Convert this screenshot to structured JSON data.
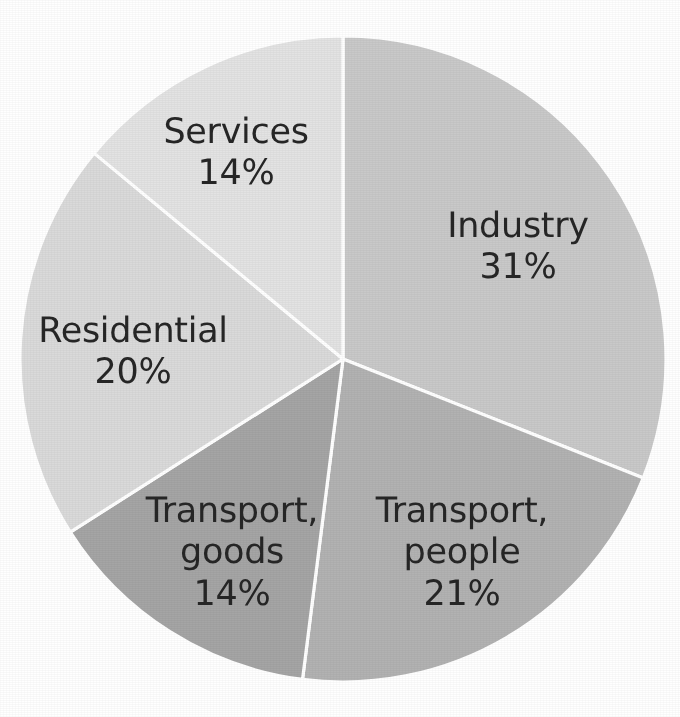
{
  "chart_data": {
    "type": "pie",
    "title": "",
    "subtitle": "",
    "xlabel": "",
    "ylabel": "",
    "legend_position": "none",
    "grid": false,
    "unit": "%",
    "label_format": "name + percent",
    "start_angle_deg": 0,
    "direction": "clockwise",
    "background_color": "#ffffff",
    "separator_color": "#ffffff",
    "label_text_color": "#262626",
    "categories": [
      "Industry",
      "Transport, people",
      "Transport, goods",
      "Residential",
      "Services"
    ],
    "values": [
      31,
      21,
      14,
      20,
      14
    ],
    "slices": [
      {
        "name": "Industry",
        "label_line1": "Industry",
        "value": 31,
        "value_label": "31%",
        "color": "#c9c9c9",
        "start_angle_deg": 0.0,
        "end_angle_deg": 111.6,
        "label_x": 518,
        "label_y": 247
      },
      {
        "name": "Transport, people",
        "label_line1": "Transport,",
        "label_line2": "people",
        "value": 21,
        "value_label": "21%",
        "color": "#b2b2b2",
        "start_angle_deg": 111.6,
        "end_angle_deg": 187.2,
        "label_x": 462,
        "label_y": 553
      },
      {
        "name": "Transport, goods",
        "label_line1": "Transport,",
        "label_line2": "goods",
        "value": 14,
        "value_label": "14%",
        "color": "#a5a5a5",
        "start_angle_deg": 187.2,
        "end_angle_deg": 237.6,
        "label_x": 232,
        "label_y": 553
      },
      {
        "name": "Residential",
        "label_line1": "Residential",
        "value": 20,
        "value_label": "20%",
        "color": "#dadada",
        "start_angle_deg": 237.6,
        "end_angle_deg": 309.6,
        "label_x": 133,
        "label_y": 352
      },
      {
        "name": "Services",
        "label_line1": "Services",
        "value": 14,
        "value_label": "14%",
        "color": "#e3e3e3",
        "start_angle_deg": 309.6,
        "end_angle_deg": 360.0,
        "label_x": 236,
        "label_y": 153
      }
    ],
    "geometry": {
      "center_x": 343,
      "center_y": 359,
      "radius": 323
    }
  }
}
